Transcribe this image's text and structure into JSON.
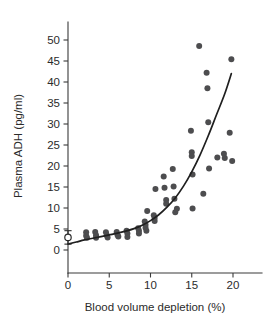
{
  "figure": {
    "background": "#ffffff",
    "marker_color": "#4d4d4f",
    "curve_color": "#1f1f1f",
    "axis_color": "#3a3a3a"
  },
  "chart_data": {
    "type": "scatter",
    "title": "",
    "xlabel": "Blood volume depletion (%)",
    "ylabel": "Plasma ADH (pg/ml)",
    "xlim": [
      -1.2,
      21.5
    ],
    "ylim": [
      -2.0,
      52.0
    ],
    "grid": false,
    "legend": null,
    "xticks": [
      0,
      5,
      10,
      15,
      20
    ],
    "xticklabels": [
      "0",
      "5",
      "10",
      "15",
      "20"
    ],
    "yticks": [
      0,
      5,
      10,
      15,
      20,
      25,
      30,
      35,
      40,
      45,
      50
    ],
    "yticklabels": [
      "0",
      "5",
      "10",
      "15",
      "20",
      "25",
      "30",
      "35",
      "40",
      "45",
      "50"
    ],
    "series": [
      {
        "name": "subjects",
        "marker": "filled-circle",
        "color": "#4d4d4f",
        "points": [
          [
            2.2,
            4.2
          ],
          [
            2.2,
            3.4
          ],
          [
            2.3,
            2.9
          ],
          [
            3.3,
            4.3
          ],
          [
            3.4,
            3.5
          ],
          [
            3.4,
            2.9
          ],
          [
            4.6,
            4.2
          ],
          [
            4.7,
            3.5
          ],
          [
            4.8,
            3.0
          ],
          [
            5.9,
            4.3
          ],
          [
            6.0,
            3.6
          ],
          [
            6.1,
            3.2
          ],
          [
            7.1,
            4.6
          ],
          [
            7.2,
            3.9
          ],
          [
            7.2,
            3.1
          ],
          [
            8.5,
            5.2
          ],
          [
            8.6,
            4.6
          ],
          [
            8.6,
            3.9
          ],
          [
            9.3,
            6.8
          ],
          [
            9.4,
            6.0
          ],
          [
            9.4,
            5.3
          ],
          [
            9.5,
            4.6
          ],
          [
            9.6,
            9.3
          ],
          [
            10.4,
            8.3
          ],
          [
            10.5,
            7.6
          ],
          [
            10.5,
            6.9
          ],
          [
            10.6,
            14.5
          ],
          [
            11.6,
            17.5
          ],
          [
            11.7,
            14.8
          ],
          [
            11.9,
            11.9
          ],
          [
            11.9,
            11.0
          ],
          [
            12.7,
            19.3
          ],
          [
            12.8,
            15.1
          ],
          [
            12.9,
            12.2
          ],
          [
            13.0,
            9.0
          ],
          [
            13.2,
            9.8
          ],
          [
            14.9,
            28.4
          ],
          [
            15.0,
            23.3
          ],
          [
            15.0,
            22.4
          ],
          [
            15.1,
            18.0
          ],
          [
            15.1,
            9.9
          ],
          [
            15.9,
            48.6
          ],
          [
            16.8,
            42.2
          ],
          [
            16.9,
            38.5
          ],
          [
            17.0,
            30.4
          ],
          [
            17.1,
            19.4
          ],
          [
            16.4,
            13.4
          ],
          [
            18.1,
            22.0
          ],
          [
            18.9,
            22.9
          ],
          [
            19.0,
            21.9
          ],
          [
            19.6,
            27.9
          ],
          [
            19.8,
            45.4
          ],
          [
            19.9,
            21.2
          ]
        ]
      },
      {
        "name": "control-basal",
        "marker": "open-circle-errorbar",
        "color": "#2b2b2b",
        "points": [
          [
            0.0,
            3.0
          ]
        ],
        "error": {
          "upper": 4.6,
          "lower": 1.4
        }
      }
    ],
    "fit_curve": {
      "name": "exponential-fit",
      "color": "#1f1f1f",
      "points": [
        [
          0.0,
          1.4
        ],
        [
          1.0,
          1.9
        ],
        [
          2.0,
          2.4
        ],
        [
          3.0,
          2.8
        ],
        [
          4.0,
          3.2
        ],
        [
          5.0,
          3.6
        ],
        [
          6.0,
          4.0
        ],
        [
          7.0,
          4.5
        ],
        [
          8.0,
          5.1
        ],
        [
          9.0,
          5.9
        ],
        [
          10.0,
          7.0
        ],
        [
          11.0,
          8.4
        ],
        [
          12.0,
          10.2
        ],
        [
          13.0,
          12.4
        ],
        [
          14.0,
          15.2
        ],
        [
          15.0,
          18.6
        ],
        [
          16.0,
          22.6
        ],
        [
          17.0,
          27.2
        ],
        [
          18.0,
          32.2
        ],
        [
          19.0,
          37.2
        ],
        [
          19.8,
          42.0
        ]
      ]
    }
  },
  "axes": {
    "ylabel": "Plasma ADH (pg/ml)",
    "xlabel": "Blood volume depletion (%)"
  }
}
